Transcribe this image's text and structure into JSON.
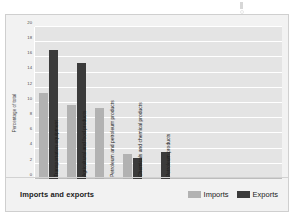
{
  "chart_data": {
    "type": "bar",
    "title": "Imports and exports",
    "xlabel": "",
    "ylabel": "Percentage of total",
    "ylim": [
      0,
      20
    ],
    "yticks": [
      20,
      18,
      16,
      14,
      12,
      10,
      8,
      6,
      4,
      2,
      0
    ],
    "grid": true,
    "legend_position": "bottom-right",
    "categories": [
      "Transportation equipment",
      "Agricultural and food products",
      "Petroleum and petroleum products",
      "Chemicals and chemical products",
      "Petroleum products"
    ],
    "series": [
      {
        "name": "Imports",
        "color": "#b2b2b2",
        "values": [
          11.3,
          9.7,
          9.3,
          3.3,
          null
        ]
      },
      {
        "name": "Exports",
        "color": "#3b3b3b",
        "values": [
          17.0,
          15.2,
          null,
          2.7,
          3.6
        ]
      }
    ]
  },
  "legend": {
    "items": [
      {
        "label": "Imports",
        "swatch": "imports"
      },
      {
        "label": "Exports",
        "swatch": "exports"
      }
    ]
  },
  "colors": {
    "imports": "#b2b2b2",
    "exports": "#3b3b3b",
    "plot_background": "#e4e4e4",
    "card_background": "#f2f2f2",
    "gridline": "#ffffff"
  }
}
